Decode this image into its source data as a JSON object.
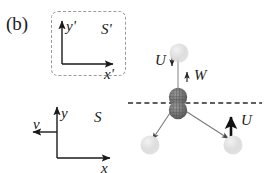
{
  "figure": {
    "panel_label": "(b)",
    "background": "#ffffff",
    "ink_color": "#1a1a1a",
    "width": 264,
    "height": 173
  },
  "frames": {
    "primed": {
      "name": "S'",
      "axis_x": "x'",
      "axis_y": "y'",
      "box_style": "dashed-rounded-rectangle"
    },
    "lab": {
      "name": "S",
      "axis_x": "x",
      "axis_y": "y",
      "velocity_label": "v",
      "velocity_direction": "left"
    }
  },
  "process": {
    "axis_line": "dashed-horizontal",
    "labels": {
      "upper_u": "U",
      "w": "W",
      "lower_u": "U"
    },
    "arrows": {
      "upper_u_direction": "down",
      "w_direction": "up",
      "lower_u_direction": "up"
    },
    "particles": {
      "core_dark_count": 2,
      "fragment_light_count": 3,
      "dark_color": "#6b6b6b",
      "light_color": "#d8d8d8"
    }
  }
}
